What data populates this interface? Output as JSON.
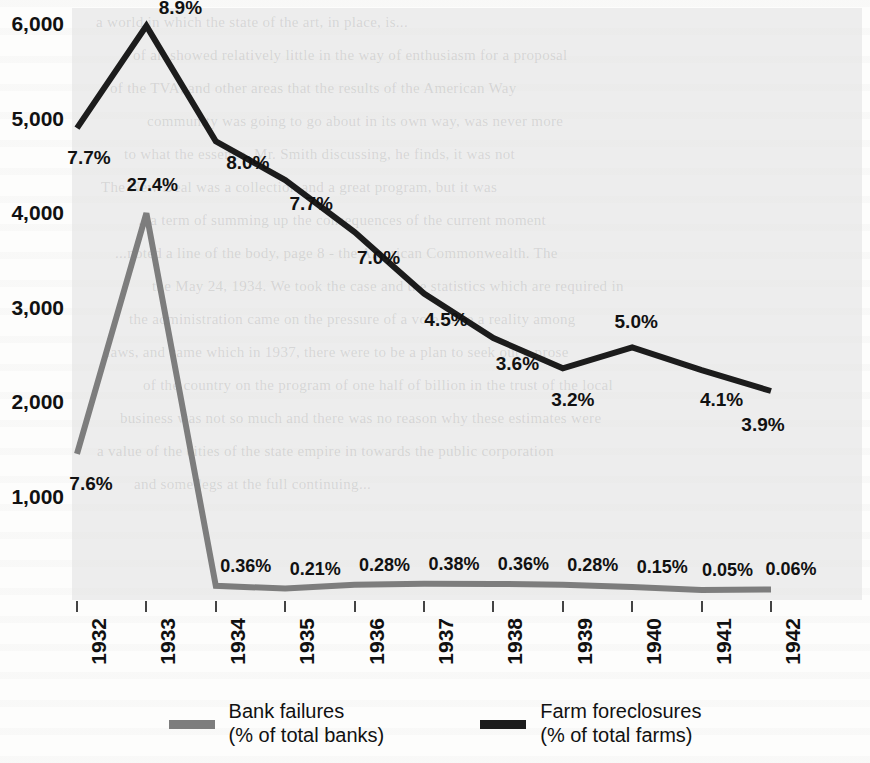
{
  "chart_data": {
    "type": "line",
    "title": "",
    "subtitle": "",
    "xlabel": "",
    "ylabel": "",
    "grid": false,
    "legend_position": "bottom",
    "categories": [
      "1932",
      "1933",
      "1934",
      "1935",
      "1936",
      "1937",
      "1938",
      "1939",
      "1940",
      "1941",
      "1942"
    ],
    "ylim": [
      0,
      6000
    ],
    "y_ticks": [
      "1,000",
      "2,000",
      "3,000",
      "4,000",
      "5,000",
      "6,000"
    ],
    "y_tick_values": [
      1000,
      2000,
      3000,
      4000,
      5000,
      6000
    ],
    "series": [
      {
        "name": "Bank failures",
        "sublabel": "(% of total banks)",
        "color": "#7d7d7d",
        "values": [
          1456,
          4000,
          61,
          32,
          72,
          84,
          81,
          72,
          48,
          17,
          23
        ],
        "point_labels": [
          "7.6%",
          "27.4%",
          "0.36%",
          "0.21%",
          "0.28%",
          "0.38%",
          "0.36%",
          "0.28%",
          "0.15%",
          "0.05%",
          "0.06%"
        ]
      },
      {
        "name": "Farm foreclosures",
        "sublabel": "(% of total farms)",
        "color": "#1c1c1c",
        "values": [
          4900,
          5980,
          4760,
          4350,
          3800,
          3150,
          2680,
          2360,
          2580,
          2340,
          2120
        ],
        "point_labels": [
          "7.7%",
          "8.9%",
          "8.0%",
          "7.7%",
          "7.0%",
          "4.5%",
          "3.6%",
          "3.2%",
          "5.0%",
          "4.1%",
          "3.9%"
        ]
      }
    ]
  },
  "legend": {
    "items": [
      {
        "name": "Bank failures",
        "line1": "Bank failures",
        "line2": "(% of total banks)",
        "color": "#7d7d7d"
      },
      {
        "name": "Farm foreclosures",
        "line1": "Farm foreclosures",
        "line2": "(% of total farms)",
        "color": "#1c1c1c"
      }
    ]
  },
  "ghost_lines": [
    "a world in which the state of the art, in place, is...",
    "of all showed relatively little in the way of enthusiasm for a proposal",
    "of the TVA, and other areas that the results of the American Way",
    "community was going to go about in its own way, was never more",
    "to what the essence. Mr. Smith discussing, he finds, it was not",
    "The New Deal was a collection and a great program, but it was",
    "...a term of summing up the consequences of the current moment",
    "...noted a line of the body, page 8 - the American Commonwealth. The",
    "the May 24, 1934. We took the case and the statistics which are required in",
    "the administration came on the pressure of a vote to be a reality among",
    "laws, and came which in 1937, there were to be a plan to seek out a prose",
    "of the country on the program of one half of billion in the trust of the local",
    "business was not so much and there was no reason why these estimates were",
    "a value of the cities of the state empire in towards the public corporation",
    "and some legs at the full continuing..."
  ]
}
